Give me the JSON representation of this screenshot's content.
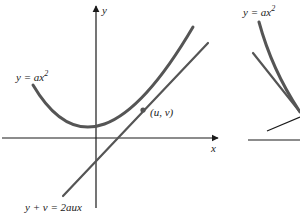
{
  "figure": {
    "left_panel": {
      "axis_labels": {
        "y": "y",
        "x": "x"
      },
      "curve_label": {
        "base": "y = ax",
        "exponent": "2"
      },
      "point_label": "(u, v)",
      "tangent_label": "y + v = 2aux"
    },
    "right_panel": {
      "curve_label": {
        "base": "y = ax",
        "exponent": "2"
      }
    },
    "colors": {
      "curve": "#555555",
      "axis": "#1a1a1a",
      "tangent": "#555555",
      "text": "#222222"
    }
  }
}
